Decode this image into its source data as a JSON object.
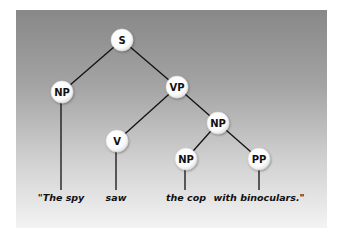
{
  "diagram": {
    "type": "parse-tree",
    "colors": {
      "panel_top": "#888888",
      "panel_bottom": "#f3f3f3",
      "edge": "#111111",
      "node_fill": "#ffffff",
      "text": "#111111"
    },
    "nodes": [
      {
        "id": "s",
        "label": "S",
        "x": 122,
        "y": 40
      },
      {
        "id": "np1",
        "label": "NP",
        "x": 62,
        "y": 92
      },
      {
        "id": "vp",
        "label": "VP",
        "x": 177,
        "y": 87
      },
      {
        "id": "v",
        "label": "V",
        "x": 117,
        "y": 141
      },
      {
        "id": "np2",
        "label": "NP",
        "x": 218,
        "y": 123
      },
      {
        "id": "np3",
        "label": "NP",
        "x": 186,
        "y": 159
      },
      {
        "id": "pp",
        "label": "PP",
        "x": 259,
        "y": 159
      }
    ],
    "edges": [
      {
        "from": "s",
        "to": "np1"
      },
      {
        "from": "s",
        "to": "vp"
      },
      {
        "from": "vp",
        "to": "v"
      },
      {
        "from": "vp",
        "to": "np2"
      },
      {
        "from": "np2",
        "to": "np3"
      },
      {
        "from": "np2",
        "to": "pp"
      }
    ],
    "words": [
      {
        "text": "\"The spy",
        "x": 61,
        "attached_to": "np1"
      },
      {
        "text": "saw",
        "x": 116,
        "attached_to": "v"
      },
      {
        "text": "the cop",
        "x": 186,
        "attached_to": "np3"
      },
      {
        "text": "with binoculars.\"",
        "x": 259,
        "attached_to": "pp"
      }
    ]
  }
}
